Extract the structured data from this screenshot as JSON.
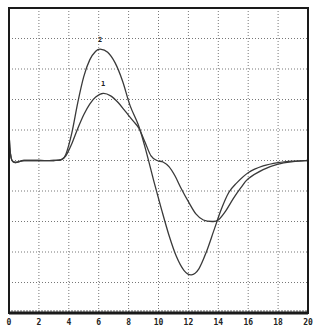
{
  "chart_data": {
    "type": "line",
    "title": "",
    "xlabel": "",
    "ylabel": "",
    "xlim": [
      0,
      20
    ],
    "ylim": [
      -5,
      5
    ],
    "x_ticks": [
      "0",
      "2",
      "4",
      "6",
      "8",
      "10",
      "12",
      "14",
      "16",
      "18",
      "20"
    ],
    "y_divisions": 10,
    "grid": true,
    "grid_style": "dotted",
    "legend": "none",
    "annotations": [
      {
        "text": "2",
        "x": 6.1,
        "y": 3.9
      },
      {
        "text": "1",
        "x": 6.3,
        "y": 2.45
      }
    ],
    "series": [
      {
        "name": "1",
        "x": [
          0,
          0.2,
          1,
          2,
          3,
          3.5,
          3.8,
          4.2,
          4.6,
          5.0,
          5.4,
          5.8,
          6.3,
          6.8,
          7.3,
          7.8,
          8.3,
          8.7,
          9.1,
          9.5,
          9.9,
          10.3,
          10.7,
          11.1,
          11.5,
          12.0,
          12.5,
          13.0,
          13.6,
          14.0,
          14.5,
          15.0,
          15.5,
          16.0,
          17.0,
          18.0,
          19.0,
          20.0
        ],
        "y": [
          0.9,
          0.0,
          0.0,
          0.0,
          0.0,
          0.03,
          0.15,
          0.55,
          1.05,
          1.5,
          1.85,
          2.08,
          2.2,
          2.12,
          1.9,
          1.6,
          1.3,
          1.05,
          0.6,
          0.15,
          0.0,
          -0.05,
          -0.2,
          -0.5,
          -0.9,
          -1.35,
          -1.75,
          -1.95,
          -2.0,
          -1.95,
          -1.65,
          -1.25,
          -0.9,
          -0.6,
          -0.3,
          -0.12,
          -0.04,
          0.0
        ]
      },
      {
        "name": "2",
        "x": [
          0,
          0.2,
          1,
          2,
          3,
          3.5,
          3.8,
          4.2,
          4.6,
          5.0,
          5.4,
          5.8,
          6.1,
          6.6,
          7.1,
          7.6,
          8.1,
          8.7,
          9.2,
          9.7,
          10.2,
          10.7,
          11.2,
          11.7,
          12.2,
          12.7,
          13.2,
          13.7,
          14.2,
          14.7,
          15.2,
          16.0,
          17.0,
          18.0,
          19.0,
          20.0
        ],
        "y": [
          0.9,
          0.0,
          0.0,
          0.0,
          0.0,
          0.03,
          0.2,
          0.9,
          1.9,
          2.75,
          3.3,
          3.58,
          3.65,
          3.55,
          3.2,
          2.6,
          1.8,
          1.1,
          0.25,
          -0.7,
          -1.6,
          -2.45,
          -3.15,
          -3.6,
          -3.75,
          -3.55,
          -3.0,
          -2.3,
          -1.6,
          -1.05,
          -0.75,
          -0.4,
          -0.18,
          -0.07,
          -0.02,
          0.0
        ]
      }
    ]
  }
}
